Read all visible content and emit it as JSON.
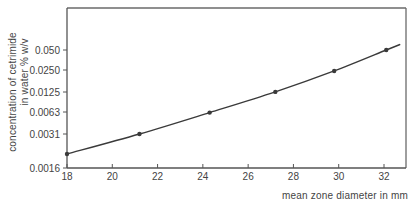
{
  "chart_data": {
    "type": "line",
    "title": "",
    "xlabel": "mean zone diameter in mm",
    "ylabel_line1": "concentration of cetrimide",
    "ylabel_line2": "in water % w/v",
    "yscale": "log2",
    "xlim": [
      18,
      33
    ],
    "ylim": [
      0.0016,
      0.1
    ],
    "x_ticks": [
      18,
      20,
      22,
      24,
      26,
      28,
      30,
      32
    ],
    "y_ticks": [
      "0.0016",
      "0.0031",
      "0.0063",
      "0.0125",
      "0.0250",
      "0.050"
    ],
    "grid": false,
    "legend": null,
    "series": [
      {
        "name": "cetrimide dose-response",
        "markers": true,
        "x": [
          18.0,
          21.2,
          24.3,
          27.2,
          29.8,
          32.1
        ],
        "y": [
          0.002,
          0.0031,
          0.0063,
          0.0125,
          0.025,
          0.05
        ]
      }
    ]
  },
  "colors": {
    "line": "#3a3a3a",
    "axis": "#555555",
    "frame": "#6a6a6a"
  }
}
